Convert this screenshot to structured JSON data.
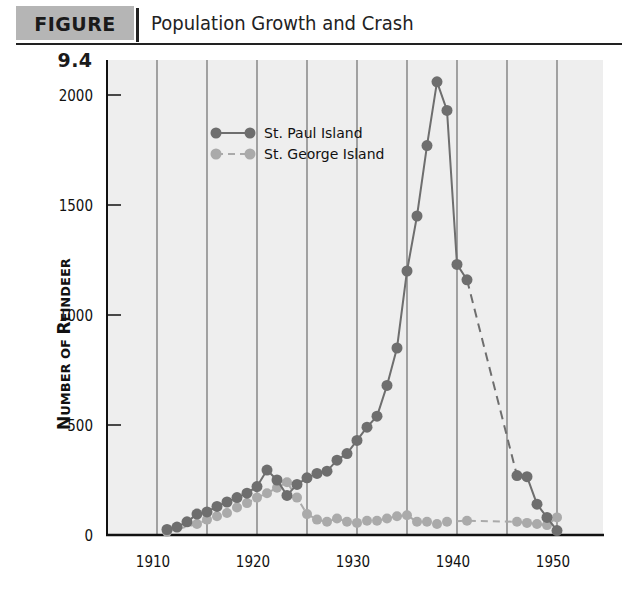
{
  "header": {
    "figure_label": "FIGURE 9.4",
    "title": "Population Growth and Crash"
  },
  "colors": {
    "st_paul": "#6e6e6e",
    "st_george": "#aaaaaa",
    "grid": "#777777",
    "plot_bg": "#eeeeee",
    "header_bg": "#b5b5b5"
  },
  "chart_data": {
    "type": "line",
    "title": "Population Growth and Crash",
    "xlabel": "",
    "ylabel": "Number of Reindeer",
    "xlim": [
      1905,
      1955
    ],
    "ylim": [
      0,
      2150
    ],
    "xticks": [
      1910,
      1920,
      1930,
      1940,
      1950
    ],
    "xgrid": [
      1910,
      1915,
      1920,
      1925,
      1930,
      1935,
      1940,
      1945,
      1950
    ],
    "yticks": [
      0,
      500,
      1000,
      1500,
      2000
    ],
    "grid": "vertical lines every 5 years",
    "legend_position": "upper left",
    "series": [
      {
        "name": "St. Paul Island",
        "style": "solid with circles; dashed between 1941 and 1946",
        "points": [
          [
            1911,
            25
          ],
          [
            1912,
            36
          ],
          [
            1913,
            60
          ],
          [
            1914,
            95
          ],
          [
            1915,
            105
          ],
          [
            1916,
            130
          ],
          [
            1917,
            150
          ],
          [
            1918,
            170
          ],
          [
            1919,
            190
          ],
          [
            1920,
            220
          ],
          [
            1921,
            295
          ],
          [
            1922,
            250
          ],
          [
            1923,
            180
          ],
          [
            1924,
            230
          ],
          [
            1925,
            260
          ],
          [
            1926,
            280
          ],
          [
            1927,
            290
          ],
          [
            1928,
            340
          ],
          [
            1929,
            370
          ],
          [
            1930,
            430
          ],
          [
            1931,
            490
          ],
          [
            1932,
            540
          ],
          [
            1933,
            680
          ],
          [
            1934,
            850
          ],
          [
            1935,
            1200
          ],
          [
            1936,
            1450
          ],
          [
            1937,
            1770
          ],
          [
            1938,
            2060
          ],
          [
            1939,
            1930
          ],
          [
            1940,
            1230
          ],
          [
            1941,
            1160
          ],
          [
            1946,
            270
          ],
          [
            1947,
            265
          ],
          [
            1948,
            140
          ],
          [
            1949,
            80
          ],
          [
            1950,
            20
          ]
        ]
      },
      {
        "name": "St. George Island",
        "style": "dashed with circles",
        "points": [
          [
            1911,
            15
          ],
          [
            1914,
            50
          ],
          [
            1915,
            70
          ],
          [
            1916,
            85
          ],
          [
            1917,
            100
          ],
          [
            1918,
            125
          ],
          [
            1919,
            145
          ],
          [
            1920,
            170
          ],
          [
            1921,
            190
          ],
          [
            1922,
            215
          ],
          [
            1923,
            240
          ],
          [
            1924,
            170
          ],
          [
            1925,
            95
          ],
          [
            1926,
            70
          ],
          [
            1927,
            60
          ],
          [
            1928,
            75
          ],
          [
            1929,
            60
          ],
          [
            1930,
            55
          ],
          [
            1931,
            65
          ],
          [
            1932,
            65
          ],
          [
            1933,
            75
          ],
          [
            1934,
            85
          ],
          [
            1935,
            90
          ],
          [
            1936,
            60
          ],
          [
            1937,
            60
          ],
          [
            1938,
            50
          ],
          [
            1939,
            60
          ],
          [
            1941,
            65
          ],
          [
            1946,
            60
          ],
          [
            1947,
            55
          ],
          [
            1948,
            50
          ],
          [
            1949,
            45
          ],
          [
            1950,
            80
          ]
        ]
      }
    ]
  },
  "legend": {
    "items": [
      {
        "label": "St. Paul Island"
      },
      {
        "label": "St. George Island"
      }
    ]
  },
  "axis": {
    "ylabel_main": "N",
    "ylabel_text": "UMBER OF ",
    "ylabel_r": "R",
    "ylabel_rest": "EINDEER",
    "ytick_labels": [
      "0",
      "500",
      "1000",
      "1500",
      "2000"
    ],
    "xtick_labels": [
      "1910",
      "1920",
      "1930",
      "1940",
      "1950"
    ]
  }
}
